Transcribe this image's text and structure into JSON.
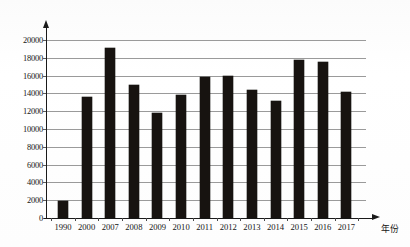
{
  "chart_data": {
    "type": "bar",
    "title": "",
    "xlabel": "年份",
    "ylabel": "",
    "categories": [
      "1990",
      "2000",
      "2007",
      "2008",
      "2009",
      "2010",
      "2011",
      "2012",
      "2013",
      "2014",
      "2015",
      "2016",
      "2017"
    ],
    "values": [
      1950,
      13600,
      19150,
      14900,
      11850,
      13800,
      15900,
      15950,
      14350,
      13200,
      17700,
      17500,
      14200
    ],
    "ylim": [
      0,
      20000
    ],
    "ytick_labels": [
      "0",
      "2000",
      "4000",
      "6000",
      "8000",
      "10000",
      "12000",
      "14000",
      "16000",
      "18000",
      "20000"
    ],
    "ytick_values": [
      0,
      2000,
      4000,
      6000,
      8000,
      10000,
      12000,
      14000,
      16000,
      18000,
      20000
    ],
    "grid": true,
    "legend": null,
    "bar_color": "#171310",
    "grid_color": "#9a9a9a",
    "axis_color": "#1a1a1a"
  },
  "axes": {
    "x_axis_name": "x-axis",
    "y_axis_name": "y-axis",
    "x_axis_title": "年份"
  }
}
